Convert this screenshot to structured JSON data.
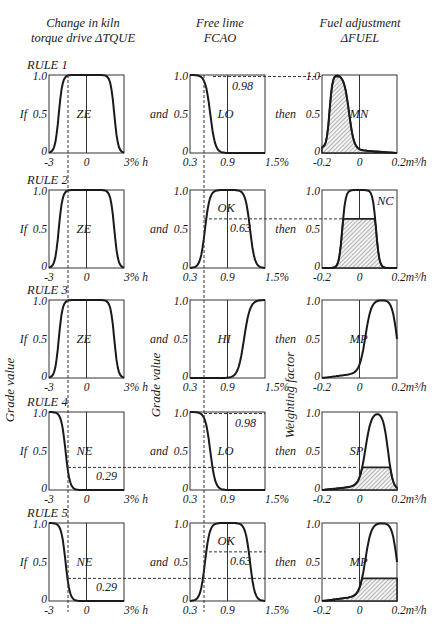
{
  "headers": {
    "col1": [
      "Change in kiln",
      "torque drive ΔTQUE"
    ],
    "col2": [
      "Free lime",
      "FCAO"
    ],
    "col3": [
      "Fuel adjustment",
      "ΔFUEL"
    ]
  },
  "side_labels": {
    "col1": "Grade value",
    "col2": "Grade value",
    "col3": "Weighting factor"
  },
  "connectors": {
    "if": "If",
    "and": "and",
    "then": "then"
  },
  "axes": {
    "col1": {
      "ticks": [
        "-3",
        "0",
        "3% h"
      ],
      "range": [
        -3,
        3
      ]
    },
    "col2": {
      "ticks": [
        "0.3",
        "0.9",
        "1.5%"
      ],
      "range": [
        0.3,
        1.5
      ]
    },
    "col3": {
      "ticks": [
        "-0.2",
        "0",
        "0.2m³/h"
      ],
      "range": [
        -0.2,
        0.2
      ]
    },
    "y_ticks": [
      "0",
      "0.5",
      "1.0"
    ]
  },
  "input_markers": {
    "torque_value": -1.9,
    "free_lime_value": 0.5
  },
  "rules": [
    {
      "label": "RULE 1",
      "torque_set": "ZE",
      "torque_degree": 1.0,
      "lime_set": "LO",
      "lime_degree": 0.98,
      "fuel_set": "MN",
      "firing": 0.98
    },
    {
      "label": "RULE 2",
      "torque_set": "ZE",
      "torque_degree": 1.0,
      "lime_set": "OK",
      "lime_degree": 0.63,
      "fuel_set": "NC",
      "firing": 0.63
    },
    {
      "label": "RULE 3",
      "torque_set": "ZE",
      "torque_degree": 1.0,
      "lime_set": "HI",
      "lime_degree": 0.0,
      "fuel_set": "MP",
      "firing": 0.0
    },
    {
      "label": "RULE 4",
      "torque_set": "NE",
      "torque_degree": 0.29,
      "lime_set": "LO",
      "lime_degree": 0.98,
      "fuel_set": "SP",
      "firing": 0.29
    },
    {
      "label": "RULE 5",
      "torque_set": "NE",
      "torque_degree": 0.29,
      "lime_set": "OK",
      "lime_degree": 0.63,
      "fuel_set": "MP",
      "firing": 0.29
    }
  ],
  "annotations": {
    "rule1_lime": "0.98",
    "rule2_lime": "0.63",
    "rule4_torque": "0.29",
    "rule4_lime": "0.98",
    "rule5_torque": "0.29",
    "rule5_lime": "0.63"
  },
  "chart_data": {
    "type": "line",
    "xlabel": [
      "Change in kiln torque drive ΔTQUE (%/h)",
      "Free lime FCAO (%)",
      "Fuel adjustment ΔFUEL (m³/h)"
    ],
    "ylabel": [
      "Grade value",
      "Grade value",
      "Weighting factor"
    ],
    "ylim": [
      0,
      1
    ],
    "membership_functions": {
      "TQUE_ZE": {
        "x": [
          -3,
          -2.4,
          -1.9,
          0,
          1.9,
          2.4,
          3
        ],
        "y": [
          0,
          0.5,
          1,
          1,
          1,
          0.5,
          0
        ]
      },
      "TQUE_NE": {
        "x": [
          -3,
          -2.4,
          -1.9,
          -1.5,
          -0.5,
          0,
          3
        ],
        "y": [
          1,
          0.98,
          0.29,
          0.12,
          0.03,
          0.02,
          0
        ]
      },
      "FCAO_LO": {
        "x": [
          0.3,
          0.45,
          0.5,
          0.65,
          0.9,
          1.5
        ],
        "y": [
          1,
          0.99,
          0.98,
          0.5,
          0.02,
          0
        ]
      },
      "FCAO_OK": {
        "x": [
          0.3,
          0.45,
          0.5,
          0.9,
          1.3,
          1.5
        ],
        "y": [
          0,
          0.5,
          0.63,
          1,
          0.5,
          0
        ]
      },
      "FCAO_HI": {
        "x": [
          0.3,
          0.9,
          1.1,
          1.3,
          1.5
        ],
        "y": [
          0,
          0.05,
          0.5,
          0.99,
          1
        ]
      },
      "FUEL_MN": {
        "x": [
          -0.2,
          -0.17,
          -0.13,
          -0.08,
          -0.03,
          0,
          0.2
        ],
        "y": [
          0.5,
          1,
          1,
          0.5,
          0.1,
          0.07,
          0
        ]
      },
      "FUEL_NC": {
        "x": [
          -0.2,
          -0.1,
          -0.07,
          0.03,
          0.07,
          0.2
        ],
        "y": [
          0,
          0.05,
          1,
          1,
          0.05,
          0
        ]
      },
      "FUEL_MP": {
        "x": [
          -0.2,
          -0.05,
          0.0,
          0.05,
          0.13,
          0.2
        ],
        "y": [
          0,
          0.1,
          0.5,
          1,
          1,
          0.5
        ]
      },
      "FUEL_SP": {
        "x": [
          -0.2,
          -0.05,
          0.0,
          0.05,
          0.1,
          0.2
        ],
        "y": [
          0,
          0.1,
          0.5,
          1,
          1,
          0.05
        ]
      }
    },
    "rule_firing_strengths": [
      {
        "rule": "RULE 1",
        "value": 0.98
      },
      {
        "rule": "RULE 2",
        "value": 0.63
      },
      {
        "rule": "RULE 3",
        "value": 0.0
      },
      {
        "rule": "RULE 4",
        "value": 0.29
      },
      {
        "rule": "RULE 5",
        "value": 0.29
      }
    ],
    "grid": false,
    "legend": "none"
  }
}
